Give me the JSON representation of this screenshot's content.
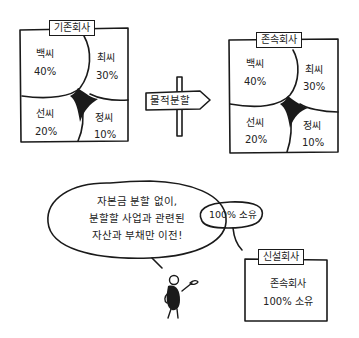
{
  "existing_company": {
    "title": "기존회사",
    "shareholders": [
      {
        "name": "백씨",
        "share": "40%"
      },
      {
        "name": "최씨",
        "share": "30%"
      },
      {
        "name": "선씨",
        "share": "20%"
      },
      {
        "name": "정씨",
        "share": "10%"
      }
    ]
  },
  "signpost": {
    "label": "물적분할"
  },
  "surviving_company": {
    "title": "존속회사",
    "shareholders": [
      {
        "name": "백씨",
        "share": "40%"
      },
      {
        "name": "최씨",
        "share": "30%"
      },
      {
        "name": "선씨",
        "share": "20%"
      },
      {
        "name": "정씨",
        "share": "10%"
      }
    ]
  },
  "speech_bubble": {
    "lines": [
      "자본금 분할 없이,",
      "분할할 사업과 관련된",
      "자산과 부채만 이전!"
    ]
  },
  "ownership_bubble": {
    "text": "100% 소유"
  },
  "new_company": {
    "title": "신설회사",
    "lines": [
      "존속회사",
      "100% 소유"
    ]
  },
  "colors": {
    "ink": "#1a1a1a",
    "background": "#ffffff"
  }
}
